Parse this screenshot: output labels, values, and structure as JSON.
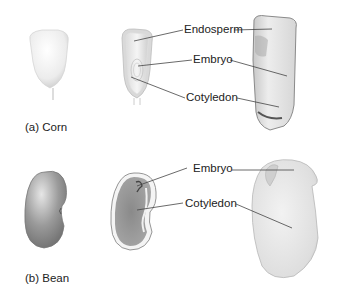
{
  "figure": {
    "panels": [
      {
        "id": "corn",
        "caption": "(a) Corn",
        "labels": [
          "Endosperm",
          "Embryo",
          "Cotyledon"
        ]
      },
      {
        "id": "bean",
        "caption": "(b) Bean",
        "labels": [
          "Embryo",
          "Cotyledon"
        ]
      }
    ]
  },
  "colors": {
    "background": "#ffffff",
    "text": "#222222",
    "leader_line": "#444444",
    "seed_light": "#eeeeee",
    "seed_shadow": "#bdbdbd",
    "bean_dark": "#8f8f8f"
  }
}
